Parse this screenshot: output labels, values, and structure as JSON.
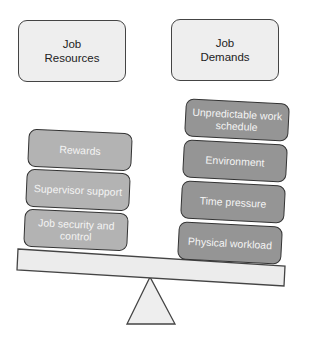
{
  "headers": {
    "resources": "Job\nResources",
    "demands": "Job\nDemands"
  },
  "resources": [
    {
      "label": "Rewards"
    },
    {
      "label": "Supervisor support"
    },
    {
      "label": "Job security and\ncontrol"
    }
  ],
  "demands": [
    {
      "label": "Unpredictable work\nschedule"
    },
    {
      "label": "Environment"
    },
    {
      "label": "Time pressure"
    },
    {
      "label": "Physical workload"
    }
  ],
  "colors": {
    "header_fill": "#eeeeee",
    "resource_fill": "#b3b3b3",
    "demand_fill": "#959595",
    "beam_fill": "#ececec",
    "outline": "#333333"
  }
}
